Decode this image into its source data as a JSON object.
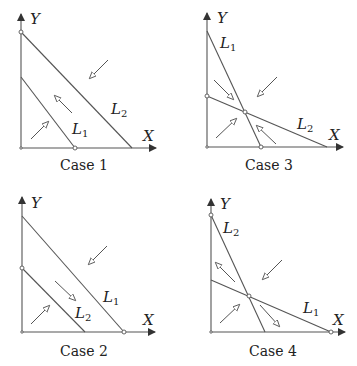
{
  "figure": {
    "panels": [
      {
        "id": "case1",
        "caption": "Case 1",
        "x_label": "X",
        "y_label": "Y",
        "lines": [
          {
            "name": "L",
            "sub": "1"
          },
          {
            "name": "L",
            "sub": "2"
          }
        ]
      },
      {
        "id": "case3",
        "caption": "Case 3",
        "x_label": "X",
        "y_label": "Y",
        "lines": [
          {
            "name": "L",
            "sub": "1"
          },
          {
            "name": "L",
            "sub": "2"
          }
        ]
      },
      {
        "id": "case2",
        "caption": "Case 2",
        "x_label": "X",
        "y_label": "Y",
        "lines": [
          {
            "name": "L",
            "sub": "1"
          },
          {
            "name": "L",
            "sub": "2"
          }
        ]
      },
      {
        "id": "case4",
        "caption": "Case 4",
        "x_label": "X",
        "y_label": "Y",
        "lines": [
          {
            "name": "L",
            "sub": "1"
          },
          {
            "name": "L",
            "sub": "2"
          }
        ]
      }
    ],
    "colors": {
      "line": "#555555",
      "text": "#222222",
      "background": "#ffffff"
    }
  }
}
